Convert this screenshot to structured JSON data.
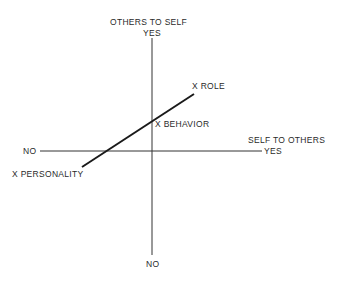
{
  "diagram": {
    "vertical_axis": {
      "title": "OTHERS TO SELF",
      "top_label": "YES",
      "bottom_label": "NO"
    },
    "horizontal_axis": {
      "title": "SELF TO OTHERS",
      "left_label": "NO",
      "right_label": "YES"
    },
    "points": [
      {
        "label": "X ROLE"
      },
      {
        "label": "X BEHAVIOR"
      },
      {
        "label": "X PERSONALITY"
      }
    ],
    "line_color": "#1a1a1a"
  }
}
